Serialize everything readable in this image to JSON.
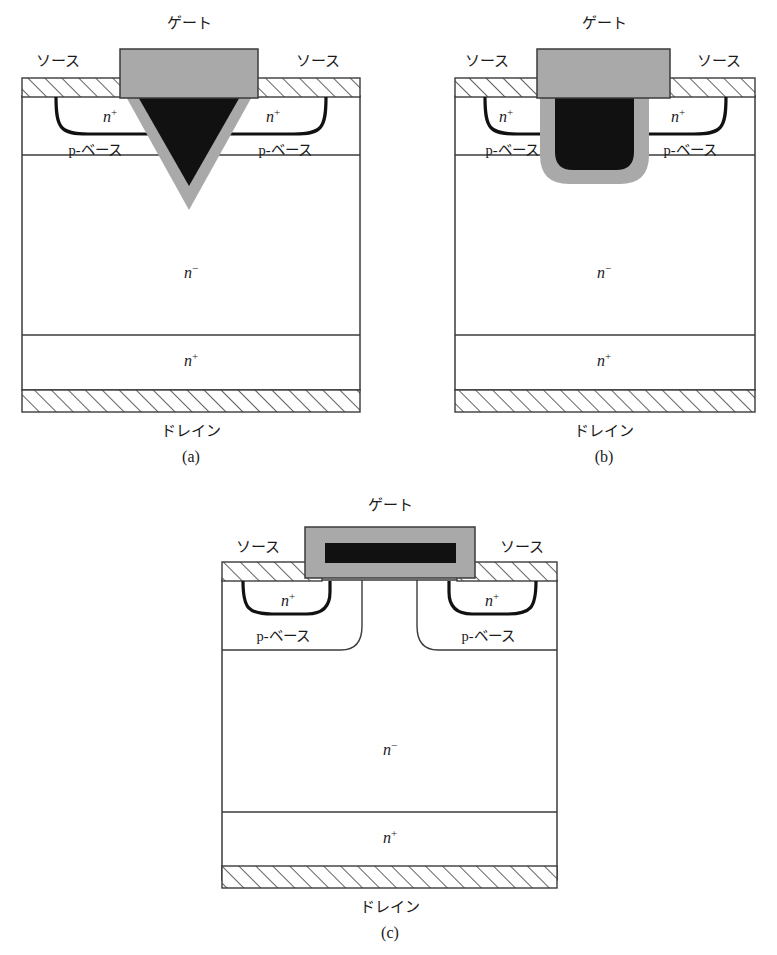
{
  "figure": {
    "title": "",
    "background": "#ffffff",
    "colors": {
      "outline": "#3b3b3b",
      "junction": "#111111",
      "oxide_gray": "#a9a9a9",
      "poly_black": "#111111",
      "metal_hatch": "#3b3b3b",
      "text": "#1a1a1a"
    },
    "labels": {
      "gate": "ゲート",
      "source": "ソース",
      "drain": "ドレイン",
      "p_base": "p-ベース",
      "n_plus_base": "n",
      "n_plus_sup": "+",
      "n_minus_base": "n",
      "n_minus_sup": "−"
    },
    "panels": [
      {
        "id": "a",
        "caption": "(a)",
        "device": "v-groove-vmos",
        "gate_label": "ゲート",
        "source_label_left": "ソース",
        "source_label_right": "ソース",
        "drain_label": "ドレイン",
        "regions": [
          {
            "name": "n-plus-source-left",
            "base": "n",
            "sup": "+"
          },
          {
            "name": "n-plus-source-right",
            "base": "n",
            "sup": "+"
          },
          {
            "name": "p-base-left",
            "label": "p-ベース"
          },
          {
            "name": "p-base-right",
            "label": "p-ベース"
          },
          {
            "name": "n-minus-drift",
            "base": "n",
            "sup": "−"
          },
          {
            "name": "n-plus-substrate",
            "base": "n",
            "sup": "+"
          }
        ]
      },
      {
        "id": "b",
        "caption": "(b)",
        "device": "u-trench-umos",
        "gate_label": "ゲート",
        "source_label_left": "ソース",
        "source_label_right": "ソース",
        "drain_label": "ドレイン",
        "regions": [
          {
            "name": "n-plus-source-left",
            "base": "n",
            "sup": "+"
          },
          {
            "name": "n-plus-source-right",
            "base": "n",
            "sup": "+"
          },
          {
            "name": "p-base-left",
            "label": "p-ベース"
          },
          {
            "name": "p-base-right",
            "label": "p-ベース"
          },
          {
            "name": "n-minus-drift",
            "base": "n",
            "sup": "−"
          },
          {
            "name": "n-plus-substrate",
            "base": "n",
            "sup": "+"
          }
        ]
      },
      {
        "id": "c",
        "caption": "(c)",
        "device": "planar-dmos",
        "gate_label": "ゲート",
        "source_label_left": "ソース",
        "source_label_right": "ソース",
        "drain_label": "ドレイン",
        "regions": [
          {
            "name": "n-plus-source-left",
            "base": "n",
            "sup": "+"
          },
          {
            "name": "n-plus-source-right",
            "base": "n",
            "sup": "+"
          },
          {
            "name": "p-base-left",
            "label": "p-ベース"
          },
          {
            "name": "p-base-right",
            "label": "p-ベース"
          },
          {
            "name": "n-minus-drift",
            "base": "n",
            "sup": "−"
          },
          {
            "name": "n-plus-substrate",
            "base": "n",
            "sup": "+"
          }
        ]
      }
    ]
  }
}
